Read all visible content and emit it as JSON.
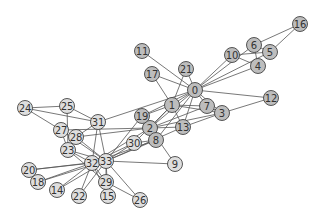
{
  "diagram": {
    "type": "network-graph",
    "title": "",
    "node_radius": 7.5,
    "colors": {
      "group_a": "#bdbdbd",
      "group_b": "#dedede",
      "edge": "#555555",
      "node_stroke": "#444444",
      "label": "#333333"
    },
    "nodes": [
      {
        "id": "0",
        "x": 195,
        "y": 90,
        "group": "a"
      },
      {
        "id": "1",
        "x": 172,
        "y": 105,
        "group": "a"
      },
      {
        "id": "2",
        "x": 150,
        "y": 128,
        "group": "a"
      },
      {
        "id": "3",
        "x": 222,
        "y": 113,
        "group": "a"
      },
      {
        "id": "4",
        "x": 258,
        "y": 66,
        "group": "a"
      },
      {
        "id": "5",
        "x": 270,
        "y": 52,
        "group": "a"
      },
      {
        "id": "6",
        "x": 254,
        "y": 45,
        "group": "a"
      },
      {
        "id": "7",
        "x": 207,
        "y": 106,
        "group": "a"
      },
      {
        "id": "8",
        "x": 156,
        "y": 140,
        "group": "a"
      },
      {
        "id": "9",
        "x": 175,
        "y": 164,
        "group": "b"
      },
      {
        "id": "10",
        "x": 232,
        "y": 55,
        "group": "a"
      },
      {
        "id": "11",
        "x": 142,
        "y": 51,
        "group": "a"
      },
      {
        "id": "12",
        "x": 271,
        "y": 98,
        "group": "a"
      },
      {
        "id": "13",
        "x": 183,
        "y": 127,
        "group": "a"
      },
      {
        "id": "14",
        "x": 57,
        "y": 190,
        "group": "b"
      },
      {
        "id": "15",
        "x": 108,
        "y": 196,
        "group": "b"
      },
      {
        "id": "16",
        "x": 300,
        "y": 24,
        "group": "a"
      },
      {
        "id": "17",
        "x": 152,
        "y": 74,
        "group": "a"
      },
      {
        "id": "18",
        "x": 38,
        "y": 182,
        "group": "b"
      },
      {
        "id": "19",
        "x": 142,
        "y": 116,
        "group": "a"
      },
      {
        "id": "20",
        "x": 29,
        "y": 170,
        "group": "b"
      },
      {
        "id": "21",
        "x": 186,
        "y": 69,
        "group": "a"
      },
      {
        "id": "22",
        "x": 79,
        "y": 196,
        "group": "b"
      },
      {
        "id": "23",
        "x": 68,
        "y": 150,
        "group": "b"
      },
      {
        "id": "24",
        "x": 25,
        "y": 108,
        "group": "b"
      },
      {
        "id": "25",
        "x": 67,
        "y": 106,
        "group": "b"
      },
      {
        "id": "26",
        "x": 140,
        "y": 200,
        "group": "b"
      },
      {
        "id": "27",
        "x": 61,
        "y": 130,
        "group": "b"
      },
      {
        "id": "28",
        "x": 76,
        "y": 137,
        "group": "b"
      },
      {
        "id": "29",
        "x": 106,
        "y": 182,
        "group": "b"
      },
      {
        "id": "30",
        "x": 134,
        "y": 143,
        "group": "b"
      },
      {
        "id": "31",
        "x": 98,
        "y": 122,
        "group": "b"
      },
      {
        "id": "32",
        "x": 92,
        "y": 163,
        "group": "b"
      },
      {
        "id": "33",
        "x": 106,
        "y": 161,
        "group": "b"
      }
    ],
    "edges": [
      [
        "0",
        "1"
      ],
      [
        "0",
        "2"
      ],
      [
        "0",
        "3"
      ],
      [
        "0",
        "4"
      ],
      [
        "0",
        "5"
      ],
      [
        "0",
        "6"
      ],
      [
        "0",
        "7"
      ],
      [
        "0",
        "8"
      ],
      [
        "0",
        "10"
      ],
      [
        "0",
        "11"
      ],
      [
        "0",
        "12"
      ],
      [
        "0",
        "13"
      ],
      [
        "0",
        "17"
      ],
      [
        "0",
        "19"
      ],
      [
        "0",
        "21"
      ],
      [
        "0",
        "31"
      ],
      [
        "1",
        "2"
      ],
      [
        "1",
        "3"
      ],
      [
        "1",
        "7"
      ],
      [
        "1",
        "13"
      ],
      [
        "1",
        "17"
      ],
      [
        "1",
        "19"
      ],
      [
        "1",
        "21"
      ],
      [
        "1",
        "30"
      ],
      [
        "2",
        "3"
      ],
      [
        "2",
        "7"
      ],
      [
        "2",
        "8"
      ],
      [
        "2",
        "9"
      ],
      [
        "2",
        "13"
      ],
      [
        "2",
        "27"
      ],
      [
        "2",
        "28"
      ],
      [
        "2",
        "32"
      ],
      [
        "3",
        "7"
      ],
      [
        "3",
        "12"
      ],
      [
        "3",
        "13"
      ],
      [
        "4",
        "6"
      ],
      [
        "4",
        "10"
      ],
      [
        "5",
        "6"
      ],
      [
        "5",
        "10"
      ],
      [
        "5",
        "16"
      ],
      [
        "6",
        "16"
      ],
      [
        "8",
        "30"
      ],
      [
        "8",
        "32"
      ],
      [
        "8",
        "33"
      ],
      [
        "9",
        "33"
      ],
      [
        "13",
        "33"
      ],
      [
        "14",
        "32"
      ],
      [
        "14",
        "33"
      ],
      [
        "15",
        "32"
      ],
      [
        "15",
        "33"
      ],
      [
        "18",
        "32"
      ],
      [
        "18",
        "33"
      ],
      [
        "19",
        "33"
      ],
      [
        "20",
        "32"
      ],
      [
        "20",
        "33"
      ],
      [
        "22",
        "32"
      ],
      [
        "22",
        "33"
      ],
      [
        "23",
        "25"
      ],
      [
        "23",
        "27"
      ],
      [
        "23",
        "29"
      ],
      [
        "23",
        "32"
      ],
      [
        "23",
        "33"
      ],
      [
        "24",
        "25"
      ],
      [
        "24",
        "27"
      ],
      [
        "24",
        "31"
      ],
      [
        "25",
        "31"
      ],
      [
        "26",
        "29"
      ],
      [
        "26",
        "33"
      ],
      [
        "27",
        "33"
      ],
      [
        "28",
        "31"
      ],
      [
        "28",
        "33"
      ],
      [
        "29",
        "32"
      ],
      [
        "29",
        "33"
      ],
      [
        "30",
        "32"
      ],
      [
        "30",
        "33"
      ],
      [
        "31",
        "32"
      ],
      [
        "31",
        "33"
      ],
      [
        "32",
        "33"
      ]
    ]
  }
}
